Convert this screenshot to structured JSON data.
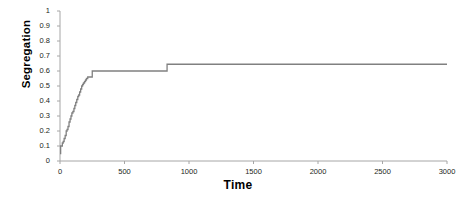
{
  "chart_data": {
    "type": "line",
    "title": "",
    "xlabel": "Time",
    "ylabel": "Segregation",
    "xlim": [
      0,
      3000
    ],
    "ylim": [
      0,
      1
    ],
    "grid": false,
    "legend": false,
    "line_color": "#808080",
    "axis_color": "#a6a6a6",
    "xticks": [
      0,
      500,
      1000,
      1500,
      2000,
      2500,
      3000
    ],
    "xtick_labels": [
      "0",
      "500",
      "1000",
      "1500",
      "2000",
      "2500",
      "3000"
    ],
    "yticks": [
      0,
      0.1,
      0.2,
      0.3,
      0.4,
      0.5,
      0.6,
      0.7,
      0.8,
      0.9,
      1
    ],
    "ytick_labels": [
      "0",
      "0.1",
      "0.2",
      "0.3",
      "0.4",
      "0.5",
      "0.6",
      "0.7",
      "0.8",
      "0.9",
      "1"
    ],
    "series": [
      {
        "name": "Segregation",
        "x": [
          0,
          5,
          10,
          18,
          25,
          32,
          40,
          48,
          55,
          62,
          70,
          78,
          85,
          92,
          100,
          108,
          115,
          122,
          130,
          138,
          145,
          152,
          160,
          168,
          175,
          182,
          190,
          198,
          205,
          215,
          250,
          830,
          3000
        ],
        "y": [
          0.05,
          0.1,
          0.1,
          0.12,
          0.13,
          0.15,
          0.17,
          0.2,
          0.21,
          0.23,
          0.26,
          0.28,
          0.3,
          0.32,
          0.33,
          0.35,
          0.37,
          0.39,
          0.41,
          0.43,
          0.44,
          0.46,
          0.48,
          0.5,
          0.51,
          0.52,
          0.53,
          0.54,
          0.55,
          0.56,
          0.6,
          0.645,
          0.645
        ]
      }
    ],
    "annotations": {
      "initial_value": 0.05,
      "first_plateau": 0.56,
      "second_plateau": 0.6,
      "final_value": 0.645
    }
  }
}
